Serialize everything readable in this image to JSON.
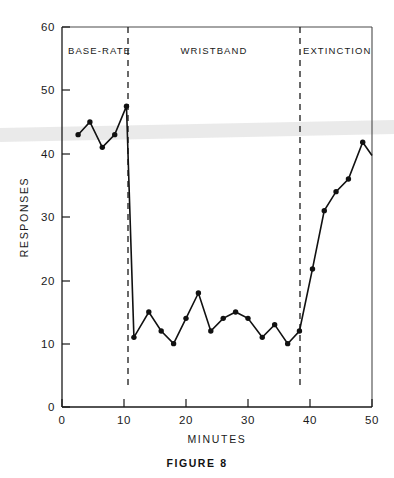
{
  "figure": {
    "caption": "FIGURE  8"
  },
  "chart_data": {
    "type": "line",
    "title": "",
    "subtitle": "",
    "xlabel": "MINUTES",
    "ylabel": "RESPONSES",
    "xlim": [
      0,
      50
    ],
    "ylim": [
      0,
      60
    ],
    "grid": false,
    "legend_position": "none",
    "x_ticks": [
      0,
      10,
      20,
      30,
      40,
      50
    ],
    "x_tick_labels": [
      "0",
      "10",
      "20",
      "30",
      "40",
      "50"
    ],
    "y_ticks": [
      0,
      10,
      20,
      30,
      40,
      50,
      60
    ],
    "y_tick_labels": [
      "0",
      "10",
      "20",
      "30",
      "40",
      "50",
      "60"
    ],
    "series": [
      {
        "name": "responses",
        "marker": "filled-circle",
        "x": [
          2.6,
          4.5,
          6.5,
          8.5,
          10.4,
          11.6,
          14.0,
          16.0,
          18.0,
          20.0,
          22.0,
          24.0,
          26.0,
          28.0,
          30.0,
          32.3,
          34.3,
          36.4,
          38.3,
          40.4,
          42.3,
          44.2,
          46.2,
          48.5,
          50.0
        ],
        "y": [
          43,
          45,
          41,
          43,
          47.5,
          11,
          15,
          12,
          10,
          14,
          18,
          12,
          14,
          15,
          14,
          11,
          13,
          10,
          12,
          21.8,
          31,
          34,
          36,
          41.8,
          39.7
        ]
      }
    ],
    "phase_dividers": [
      {
        "x": 10.6,
        "label": "base-to-wristband"
      },
      {
        "x": 38.4,
        "label": "wristband-to-extinction"
      }
    ],
    "phase_labels": [
      {
        "text": "BASE-RATE",
        "x_start": 0.5,
        "x_end": 10.6,
        "anchor": "start",
        "x": 1.2
      },
      {
        "text": "WRISTBAND",
        "x_start": 10.6,
        "x_end": 38.4,
        "anchor": "middle",
        "x": 24.5
      },
      {
        "text": "EXTINCTION",
        "x_start": 38.4,
        "x_end": 50,
        "anchor": "start",
        "x": 39.0
      }
    ],
    "annotations": [
      "Dashed vertical lines separate the BASE-RATE, WRISTBAND and EXTINCTION phases.",
      "Responses drop sharply at the onset of the WRISTBAND phase and recover during EXTINCTION."
    ]
  },
  "colors": {
    "line": "#111111",
    "marker": "#111111",
    "axis": "#1a1a1a",
    "frame": "#4a4a4a",
    "background": "#ffffff"
  }
}
